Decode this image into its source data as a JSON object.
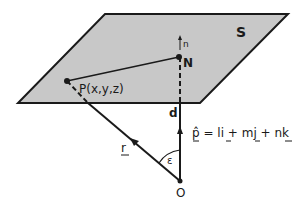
{
  "diagram": {
    "plane_label": "S",
    "point_N_label": "N",
    "point_P_label": "P(x,y,z)",
    "origin_label": "O",
    "normal_label": "n",
    "distance_label": "d",
    "vector_r_label": "r",
    "angle_label": "ε",
    "equation": "p̂ = li + mj + nk",
    "equation_parts": {
      "p": "p̂",
      "eq": " = l",
      "i": "i",
      "plus1": " + m",
      "j": "j",
      "plus2": " + n",
      "k": "k"
    },
    "colors": {
      "plane_fill": "#c8c8c8",
      "stroke": "#1a1a1a",
      "background": "#ffffff"
    }
  }
}
